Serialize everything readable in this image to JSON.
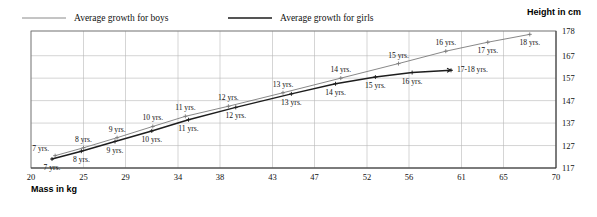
{
  "chart_data": {
    "type": "line",
    "title": "",
    "xlabel": "Mass in kg",
    "ylabel": "Height in cm",
    "xlim": [
      20,
      70
    ],
    "ylim": [
      117,
      178
    ],
    "xticks": [
      20,
      25,
      29,
      34,
      38,
      43,
      47,
      52,
      56,
      61,
      65,
      70
    ],
    "yticks": [
      117,
      127,
      137,
      147,
      157,
      167,
      178
    ],
    "grid": true,
    "legend_position": "top",
    "series": [
      {
        "name": "Average growth for boys",
        "color": "#7a7a7a",
        "points": [
          {
            "x": 22.3,
            "y": 122.5,
            "label": "7 yrs.",
            "label_pos": "above-left"
          },
          {
            "x": 25.0,
            "y": 126.0,
            "label": "8 yrs.",
            "label_pos": "above"
          },
          {
            "x": 28.2,
            "y": 130.5,
            "label": "9 yrs.",
            "label_pos": "above"
          },
          {
            "x": 31.6,
            "y": 135.5,
            "label": "10 yrs.",
            "label_pos": "above"
          },
          {
            "x": 34.7,
            "y": 140.0,
            "label": "11 yrs.",
            "label_pos": "above"
          },
          {
            "x": 38.8,
            "y": 144.5,
            "label": "12 yrs.",
            "label_pos": "above"
          },
          {
            "x": 44.0,
            "y": 150.5,
            "label": "13 yrs.",
            "label_pos": "above"
          },
          {
            "x": 49.5,
            "y": 157.0,
            "label": "14 yrs.",
            "label_pos": "above"
          },
          {
            "x": 55.0,
            "y": 163.5,
            "label": "15 yrs.",
            "label_pos": "above"
          },
          {
            "x": 59.5,
            "y": 169.0,
            "label": "16 yrs.",
            "label_pos": "above"
          },
          {
            "x": 63.5,
            "y": 173.0,
            "label": "17 yrs.",
            "label_pos": "below"
          },
          {
            "x": 67.5,
            "y": 176.5,
            "label": "18 yrs.",
            "label_pos": "below"
          }
        ]
      },
      {
        "name": "Average growth for girls",
        "color": "#1d1d1d",
        "points": [
          {
            "x": 22.0,
            "y": 121.0,
            "label": "7 yrs.",
            "label_pos": "below"
          },
          {
            "x": 24.8,
            "y": 124.5,
            "label": "8 yrs.",
            "label_pos": "below"
          },
          {
            "x": 28.0,
            "y": 128.8,
            "label": "9 yrs.",
            "label_pos": "below"
          },
          {
            "x": 31.5,
            "y": 133.5,
            "label": "10 yrs.",
            "label_pos": "below"
          },
          {
            "x": 35.0,
            "y": 138.5,
            "label": "11 yrs.",
            "label_pos": "below"
          },
          {
            "x": 39.5,
            "y": 144.0,
            "label": "12 yrs.",
            "label_pos": "below"
          },
          {
            "x": 44.8,
            "y": 150.0,
            "label": "13 yrs.",
            "label_pos": "below"
          },
          {
            "x": 49.0,
            "y": 154.5,
            "label": "14 yrs.",
            "label_pos": "below"
          },
          {
            "x": 52.8,
            "y": 157.5,
            "label": "15 yrs.",
            "label_pos": "below"
          },
          {
            "x": 56.3,
            "y": 159.5,
            "label": "16 yrs.",
            "label_pos": "below"
          },
          {
            "x": 60.0,
            "y": 160.5,
            "label": "17-18 yrs.",
            "label_pos": "right"
          }
        ]
      }
    ]
  },
  "legend": {
    "boys": "Average growth for boys",
    "girls": "Average growth for girls"
  },
  "axes": {
    "x_title": "Mass in kg",
    "y_title": "Height in cm"
  }
}
